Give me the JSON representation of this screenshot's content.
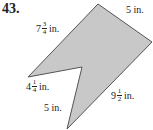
{
  "problem_number": "43.",
  "shape": {
    "fill": "#c8c8c8",
    "stroke": "#555555",
    "points": [
      [
        98,
        4
      ],
      [
        152,
        42
      ],
      [
        67,
        129
      ],
      [
        82,
        67
      ],
      [
        28,
        77
      ]
    ]
  },
  "labels": {
    "top_left_side": {
      "whole": "7",
      "num": "3",
      "den": "4",
      "unit": "in."
    },
    "top_right_side": {
      "text": "5 in."
    },
    "left_notch_side": {
      "whole": "4",
      "num": "1",
      "den": "4",
      "unit": "in."
    },
    "bottom_left_side": {
      "text": "5 in."
    },
    "bottom_right_side": {
      "whole": "9",
      "num": "1",
      "den": "2",
      "unit": "in."
    }
  }
}
